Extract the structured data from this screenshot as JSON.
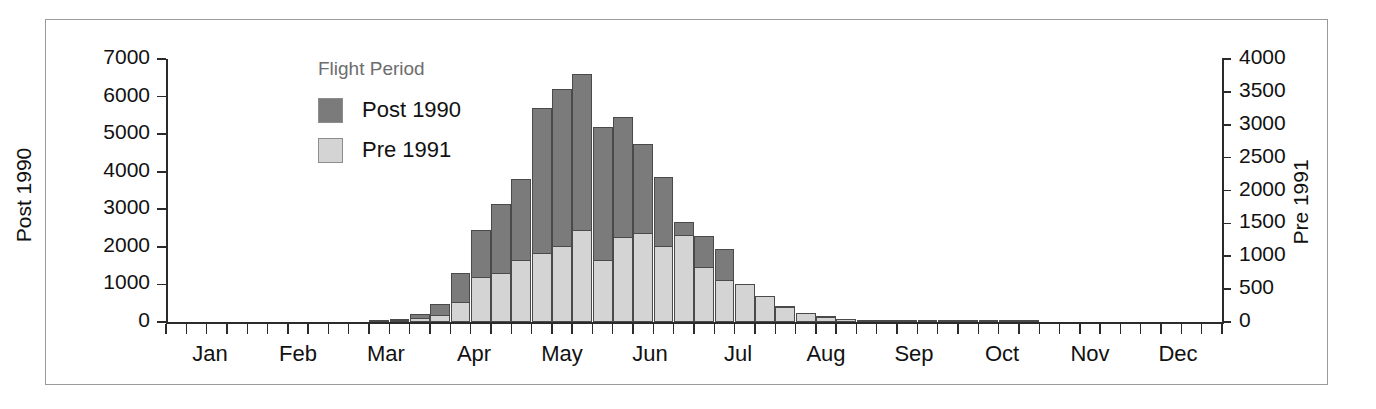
{
  "legend": {
    "title": "Flight Period",
    "items": [
      {
        "label": "Post 1990",
        "color": "#7b7b7b",
        "key": "post1990"
      },
      {
        "label": "Pre 1991",
        "color": "#d4d4d4",
        "key": "pre1991"
      }
    ]
  },
  "axes": {
    "left_title": "Post 1990",
    "right_title": "Pre 1991",
    "left_ticks": [
      "0",
      "1000",
      "2000",
      "3000",
      "4000",
      "5000",
      "6000",
      "7000"
    ],
    "right_ticks": [
      "0",
      "500",
      "1000",
      "1500",
      "2000",
      "2500",
      "3000",
      "3500",
      "4000"
    ],
    "months": [
      "Jan",
      "Feb",
      "Mar",
      "Apr",
      "May",
      "Jun",
      "Jul",
      "Aug",
      "Sep",
      "Oct",
      "Nov",
      "Dec"
    ]
  },
  "chart_data": {
    "type": "bar",
    "title": "",
    "xlabel": "",
    "ylabel": "Post 1990",
    "y2label": "Pre 1991",
    "ylim": [
      0,
      7000
    ],
    "y2lim": [
      0,
      4000
    ],
    "grid": false,
    "legend_position": "inside-upper-left",
    "legend_title": "Flight Period",
    "bar_style": "overlaid",
    "x_unit": "week",
    "x_note": "52 weekly bins across the calendar year; month tick labels centered on each month",
    "categories": [
      "Jan w1",
      "Jan w2",
      "Jan w3",
      "Jan w4",
      "Feb w1",
      "Feb w2",
      "Feb w3",
      "Feb w4",
      "Mar w1",
      "Mar w2",
      "Mar w3",
      "Mar w4",
      "Apr w1",
      "Apr w2",
      "Apr w3",
      "Apr w4",
      "May w1",
      "May w2",
      "May w3",
      "May w4",
      "Jun w1",
      "Jun w2",
      "Jun w3",
      "Jun w4",
      "Jul w1",
      "Jul w2",
      "Jul w3",
      "Jul w4",
      "Aug w1",
      "Aug w2",
      "Aug w3",
      "Aug w4",
      "Sep w1",
      "Sep w2",
      "Sep w3",
      "Sep w4",
      "Oct w1",
      "Oct w2",
      "Oct w3",
      "Oct w4",
      "Nov w1",
      "Nov w2",
      "Nov w3",
      "Nov w4",
      "Dec w1",
      "Dec w2",
      "Dec w3",
      "Dec w4",
      "Dec w5",
      "Dec w6",
      "Dec w7",
      "Dec w8"
    ],
    "series": [
      {
        "name": "Post 1990",
        "axis": "left",
        "color": "#7b7b7b",
        "values": [
          0,
          0,
          0,
          0,
          0,
          0,
          0,
          0,
          0,
          0,
          30,
          80,
          200,
          470,
          1300,
          2450,
          3150,
          3800,
          5700,
          6200,
          6600,
          5200,
          5450,
          4750,
          3850,
          2650,
          2300,
          1950,
          1000,
          700,
          420,
          250,
          150,
          90,
          55,
          35,
          20,
          12,
          8,
          5,
          3,
          2,
          1,
          0,
          0,
          0,
          0,
          0,
          0,
          0,
          0,
          0
        ]
      },
      {
        "name": "Pre 1991",
        "axis": "right",
        "color": "#d4d4d4",
        "values": [
          0,
          0,
          0,
          0,
          0,
          0,
          0,
          0,
          0,
          0,
          10,
          25,
          60,
          110,
          300,
          680,
          750,
          950,
          1050,
          1150,
          1400,
          950,
          1300,
          1350,
          1150,
          1320,
          830,
          640,
          580,
          400,
          230,
          140,
          80,
          50,
          30,
          18,
          10,
          6,
          4,
          3,
          2,
          1,
          0,
          0,
          0,
          0,
          0,
          0,
          0,
          0,
          0,
          0
        ]
      }
    ]
  }
}
